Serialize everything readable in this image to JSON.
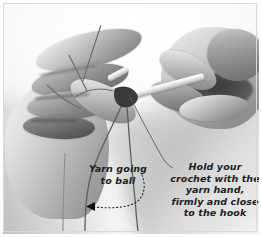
{
  "figure": {
    "kind": "instructional-photograph",
    "palette": {
      "background": "#ffffff",
      "border": "#d8d8d8",
      "ink": "#1d1d1d",
      "arrow": "#111111",
      "skin_light": "#f2f2f2",
      "skin_mid": "#b8b8b8",
      "skin_dark": "#7a7a7a",
      "shadow": "#8a8a8a"
    }
  },
  "annotations": {
    "yarn_ball": {
      "name": "yarn-going-to-ball",
      "lines": [
        "Yarn going",
        "to ball"
      ],
      "leader": "dotted-curve-with-left-arrowhead"
    },
    "hold_crochet": {
      "name": "hold-your-crochet",
      "lines": [
        "Hold your",
        "crochet with the",
        "yarn hand,",
        "firmly and close",
        "to the hook"
      ],
      "leader": "thin-solid-curve"
    }
  },
  "objects": {
    "left_hand": "yarn-hand",
    "right_hand": "hook-hand",
    "hook": "crochet-hook",
    "yarn_strand_working": "working-yarn",
    "yarn_strand_tail": "yarn-tail-to-ball"
  }
}
